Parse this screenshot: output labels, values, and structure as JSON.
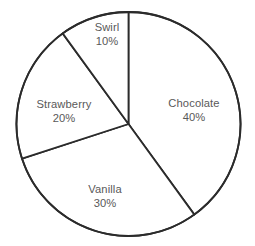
{
  "chart_data": {
    "type": "pie",
    "title": "",
    "subtitle": "",
    "xlabel": "",
    "ylabel": "",
    "legend_position": "none",
    "grid": false,
    "start_angle_deg": 0,
    "direction": "clockwise",
    "labels_inside": true,
    "categories": [
      "Chocolate",
      "Vanilla",
      "Strawberry",
      "Swirl"
    ],
    "values": [
      40,
      30,
      20,
      10
    ],
    "value_suffix": "%",
    "slices": [
      {
        "name": "Chocolate",
        "value": 40,
        "value_text": "40%",
        "start_deg": 0,
        "end_deg": 144,
        "fill": "#ffffff",
        "label_x": 194,
        "label_y": 111
      },
      {
        "name": "Vanilla",
        "value": 30,
        "value_text": "30%",
        "start_deg": 144,
        "end_deg": 252,
        "fill": "#ffffff",
        "label_x": 105,
        "label_y": 197
      },
      {
        "name": "Strawberry",
        "value": 20,
        "value_text": "20%",
        "start_deg": 252,
        "end_deg": 324,
        "fill": "#ffffff",
        "label_x": 64,
        "label_y": 112
      },
      {
        "name": "Swirl",
        "value": 10,
        "value_text": "10%",
        "start_deg": 324,
        "end_deg": 360,
        "fill": "#ffffff",
        "label_x": 107,
        "label_y": 35
      }
    ],
    "geometry": {
      "center_x": 128.5,
      "center_y": 124,
      "radius": 112
    },
    "style": {
      "background": "#ffffff",
      "stroke": "#2b2b2b",
      "stroke_width": 1.8,
      "label_color": "#595959"
    }
  }
}
